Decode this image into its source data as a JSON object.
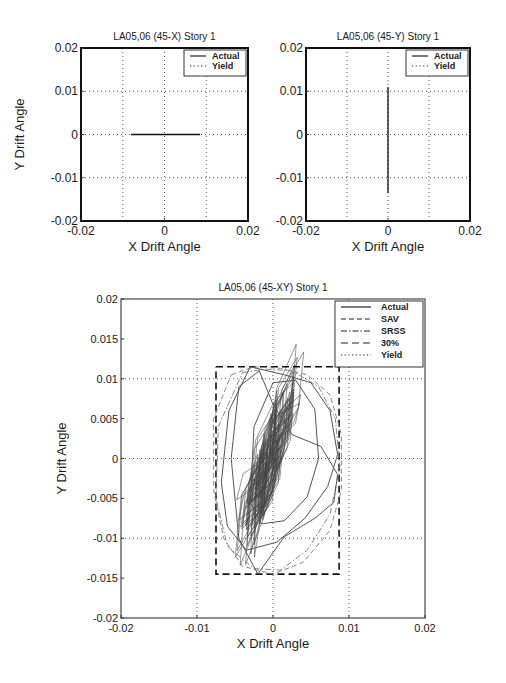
{
  "chart_data": [
    {
      "id": "chart-x",
      "type": "line",
      "title": "LA05,06 (45-X) Story 1",
      "xlabel": "X Drift Angle",
      "ylabel": "Y Drift Angle",
      "xlim": [
        -0.02,
        0.02
      ],
      "ylim": [
        -0.02,
        0.02
      ],
      "xticks": [
        -0.02,
        0,
        0.02
      ],
      "xtick_labels": [
        "-0.02",
        "0",
        "0.02"
      ],
      "yticks": [
        0.02,
        0.01,
        0,
        -0.01,
        -0.02
      ],
      "ytick_labels": [
        "0.02",
        "0.01",
        "0",
        "-0.01",
        "-0.02"
      ],
      "grid": true,
      "grid_lines_x": [
        -0.01,
        0,
        0.01
      ],
      "grid_lines_y": [
        0.01,
        0,
        -0.01
      ],
      "legend": [
        "Actual",
        "Yield"
      ],
      "legend_position": "upper right",
      "series": [
        {
          "name": "Actual",
          "style": "solid",
          "x": [
            -0.008,
            0.0085
          ],
          "y": [
            0,
            0
          ]
        }
      ]
    },
    {
      "id": "chart-y",
      "type": "line",
      "title": "LA05,06 (45-Y) Story 1",
      "xlabel": "X Drift Angle",
      "ylabel": "",
      "xlim": [
        -0.02,
        0.02
      ],
      "ylim": [
        -0.02,
        0.02
      ],
      "xticks": [
        -0.02,
        0,
        0.02
      ],
      "xtick_labels": [
        "-0.02",
        "0",
        "0.02"
      ],
      "yticks": [
        0.02,
        0.01,
        0,
        -0.01,
        -0.02
      ],
      "ytick_labels": [
        "0.02",
        "0.01",
        "0",
        "-0.01",
        "-0.02"
      ],
      "grid": true,
      "grid_lines_x": [
        -0.01,
        0,
        0.01
      ],
      "grid_lines_y": [
        0.01,
        0,
        -0.01
      ],
      "legend": [
        "Actual",
        "Yield"
      ],
      "legend_position": "upper right",
      "series": [
        {
          "name": "Actual",
          "style": "solid",
          "x": [
            0,
            0
          ],
          "y": [
            0.011,
            -0.0135
          ]
        }
      ]
    },
    {
      "id": "chart-xy",
      "type": "line",
      "title": "LA05,06 (45-XY) Story 1",
      "xlabel": "X Drift Angle",
      "ylabel": "Y Drift Angle",
      "xlim": [
        -0.02,
        0.02
      ],
      "ylim": [
        -0.02,
        0.02
      ],
      "xticks": [
        -0.02,
        -0.01,
        0,
        0.01,
        0.02
      ],
      "xtick_labels": [
        "-0.02",
        "-0.01",
        "0",
        "0.01",
        "0.02"
      ],
      "yticks": [
        0.02,
        0.015,
        0.01,
        0.005,
        0,
        -0.005,
        -0.01,
        -0.015,
        -0.02
      ],
      "ytick_labels": [
        "0.02",
        "0.015",
        "0.01",
        "0.005",
        "0",
        "-0.005",
        "-0.01",
        "-0.015",
        "-0.02"
      ],
      "grid": true,
      "grid_lines_x": [
        -0.01,
        0,
        0.01
      ],
      "grid_lines_y": [
        0.01,
        0,
        -0.01
      ],
      "legend": [
        "Actual",
        "SAV",
        "SRSS",
        "30%",
        "Yield"
      ],
      "legend_position": "upper right",
      "series": [
        {
          "name": "30%",
          "style": "longdash",
          "x": [
            -0.0075,
            0.0087,
            0.0087,
            -0.0075,
            -0.0075
          ],
          "y": [
            0.0115,
            0.0115,
            -0.0145,
            -0.0145,
            0.0115
          ]
        },
        {
          "name": "SAV",
          "style": "dash",
          "x": [
            -0.0055,
            -0.0025,
            0.001,
            0.0045,
            0.0075,
            0.009,
            0.009,
            0.0075,
            0.004,
            0.0,
            -0.004,
            -0.0065,
            -0.0078,
            -0.0078,
            -0.0055
          ],
          "y": [
            0.0105,
            0.0115,
            0.0113,
            0.0105,
            0.008,
            0.003,
            -0.004,
            -0.009,
            -0.013,
            -0.0145,
            -0.0135,
            -0.01,
            -0.004,
            0.005,
            0.0105
          ]
        },
        {
          "name": "SRSS",
          "style": "dashdot",
          "x": [
            -0.004,
            -0.001,
            0.0025,
            0.006,
            0.0082,
            0.0088,
            0.0075,
            0.0045,
            0.001,
            -0.0025,
            -0.006,
            -0.0075,
            -0.0072,
            -0.004
          ],
          "y": [
            0.0108,
            0.0112,
            0.011,
            0.009,
            0.005,
            -0.001,
            -0.007,
            -0.0115,
            -0.014,
            -0.0138,
            -0.011,
            -0.005,
            0.004,
            0.0108
          ]
        },
        {
          "name": "Actual",
          "style": "solid",
          "x": [
            -0.003,
            0.0015,
            0.005,
            0.0075,
            0.0085,
            0.0072,
            0.0042,
            0.0005,
            -0.0035,
            -0.006,
            -0.0068,
            -0.0058,
            -0.003
          ],
          "y": [
            0.0115,
            0.0105,
            0.0095,
            0.006,
            0.0005,
            -0.0035,
            -0.0075,
            -0.0105,
            -0.0115,
            -0.0085,
            -0.003,
            0.006,
            0.0115
          ]
        },
        {
          "name": "Actual-2",
          "style": "solid",
          "x": [
            -0.0045,
            -0.0018,
            0.0,
            0.0025,
            0.0063,
            0.0085,
            0.008,
            0.0055,
            0.0015,
            -0.002,
            -0.0045,
            -0.0055,
            -0.0045
          ],
          "y": [
            0.009,
            0.011,
            0.0068,
            0.003,
            0.0015,
            -0.002,
            -0.0055,
            -0.0075,
            -0.0098,
            -0.0145,
            -0.01,
            0.0,
            0.009
          ]
        },
        {
          "name": "Actual-3",
          "style": "solid",
          "x": [
            0.0,
            0.003,
            0.0055,
            0.006,
            0.0045,
            0.0015,
            -0.0015,
            -0.003,
            -0.0025,
            0.0
          ],
          "y": [
            0.0095,
            0.0098,
            0.0062,
            0.0,
            -0.0048,
            -0.0078,
            -0.0082,
            -0.0055,
            0.004,
            0.0095
          ]
        }
      ],
      "dense_core": {
        "x_center": -0.0005,
        "y_center": 0.0,
        "x_half_width": 0.0025,
        "y_half_height": 0.0065,
        "tilt": "positive slope",
        "note": "dense cluster of hysteresis loops around origin"
      }
    }
  ],
  "layout": {
    "charts": [
      {
        "plot": {
          "left": 81,
          "top": 48,
          "right": 248,
          "bottom": 221
        }
      },
      {
        "plot": {
          "left": 306,
          "top": 48,
          "right": 470,
          "bottom": 221
        }
      },
      {
        "plot": {
          "left": 121,
          "top": 299,
          "right": 425,
          "bottom": 618
        }
      }
    ]
  }
}
